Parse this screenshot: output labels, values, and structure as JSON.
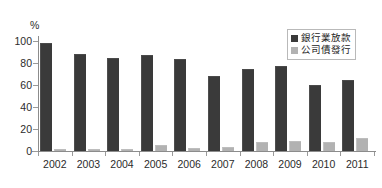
{
  "chart_data": {
    "type": "bar",
    "title": "",
    "subtitle": "",
    "xlabel": "",
    "ylabel": "%",
    "unit_label": "%",
    "categories": [
      "2002",
      "2003",
      "2004",
      "2005",
      "2006",
      "2007",
      "2008",
      "2009",
      "2010",
      "2011"
    ],
    "ylim": [
      0,
      100
    ],
    "yticks": [
      0,
      20,
      40,
      60,
      80,
      100
    ],
    "ytick_labels": [
      "0",
      "20",
      "40",
      "60",
      "80",
      "100"
    ],
    "grid": false,
    "legend_position": "top-right",
    "series": [
      {
        "name": "銀行業放款",
        "color": "#3a3a3a",
        "values": [
          97,
          87.5,
          83.5,
          86,
          83,
          67,
          73.5,
          76,
          59,
          63.5
        ]
      },
      {
        "name": "公司債發行",
        "color": "#b2b2b2",
        "values": [
          0.5,
          0.8,
          1,
          4.5,
          1.5,
          2.5,
          7.5,
          8.5,
          7.5,
          10.5
        ]
      }
    ]
  },
  "legend": {
    "items": [
      {
        "label": "銀行業放款",
        "swatch": "dark"
      },
      {
        "label": "公司債發行",
        "swatch": "light"
      }
    ]
  }
}
